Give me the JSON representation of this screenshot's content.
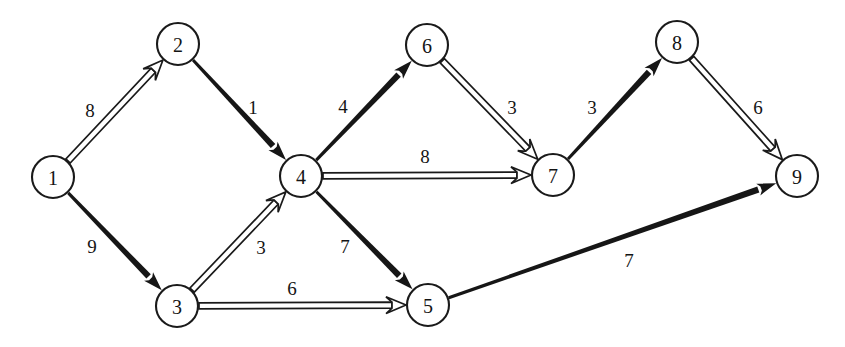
{
  "diagram": {
    "type": "directed-weighted-graph",
    "background_color": "#ffffff",
    "stroke_color": "#1a1a1a",
    "node_fill_color": "#ffffff",
    "node_radius": 21,
    "width": 845,
    "height": 347,
    "nodes": [
      {
        "id": "1",
        "label": "1",
        "x": 53,
        "y": 177
      },
      {
        "id": "2",
        "label": "2",
        "x": 178,
        "y": 44
      },
      {
        "id": "3",
        "label": "3",
        "x": 177,
        "y": 306
      },
      {
        "id": "4",
        "label": "4",
        "x": 301,
        "y": 176
      },
      {
        "id": "5",
        "label": "5",
        "x": 428,
        "y": 305
      },
      {
        "id": "6",
        "label": "6",
        "x": 427,
        "y": 45
      },
      {
        "id": "7",
        "label": "7",
        "x": 553,
        "y": 175
      },
      {
        "id": "8",
        "label": "8",
        "x": 677,
        "y": 42
      },
      {
        "id": "9",
        "label": "9",
        "x": 797,
        "y": 176
      }
    ],
    "edges": [
      {
        "from": "1",
        "to": "2",
        "weight": "8",
        "style": "hollow",
        "label_x": 90,
        "label_y": 110
      },
      {
        "from": "1",
        "to": "3",
        "weight": "9",
        "style": "solid",
        "label_x": 92,
        "label_y": 246
      },
      {
        "from": "2",
        "to": "4",
        "weight": "1",
        "style": "solid",
        "label_x": 253,
        "label_y": 107
      },
      {
        "from": "3",
        "to": "4",
        "weight": "3",
        "style": "hollow",
        "label_x": 261,
        "label_y": 247
      },
      {
        "from": "3",
        "to": "5",
        "weight": "6",
        "style": "hollow",
        "label_x": 292,
        "label_y": 288
      },
      {
        "from": "4",
        "to": "6",
        "weight": "4",
        "style": "solid",
        "label_x": 343,
        "label_y": 106
      },
      {
        "from": "4",
        "to": "7",
        "weight": "8",
        "style": "hollow",
        "label_x": 425,
        "label_y": 156
      },
      {
        "from": "4",
        "to": "5",
        "weight": "7",
        "style": "solid",
        "label_x": 345,
        "label_y": 246
      },
      {
        "from": "6",
        "to": "7",
        "weight": "3",
        "style": "hollow",
        "label_x": 512,
        "label_y": 107
      },
      {
        "from": "7",
        "to": "8",
        "weight": "3",
        "style": "solid",
        "label_x": 592,
        "label_y": 107
      },
      {
        "from": "8",
        "to": "9",
        "weight": "6",
        "style": "hollow",
        "label_x": 758,
        "label_y": 107
      },
      {
        "from": "5",
        "to": "9",
        "weight": "7",
        "style": "solid",
        "label_x": 629,
        "label_y": 260
      }
    ]
  }
}
